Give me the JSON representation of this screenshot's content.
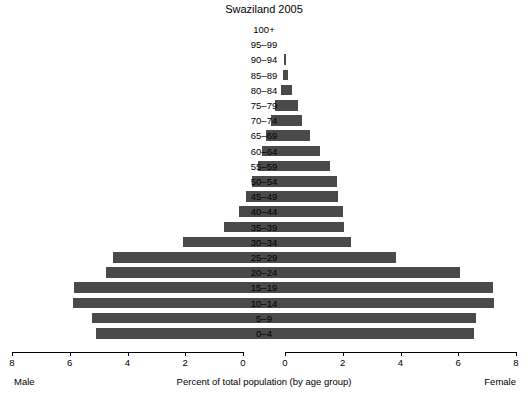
{
  "chart_data": {
    "type": "bar",
    "title": "Swaziland 2005",
    "xlabel": "Percent of total population (by age group)",
    "ylabel": "",
    "orientation": "population-pyramid",
    "left_series_label": "Male",
    "right_series_label": "Female",
    "xlim": [
      0,
      8
    ],
    "xticks": [
      8,
      6,
      4,
      2,
      0
    ],
    "xticks_right": [
      0,
      2,
      4,
      6,
      8
    ],
    "grid": false,
    "legend": "none",
    "bar_color": "#4a4a4a",
    "categories": [
      "100+",
      "95–99",
      "90–94",
      "85–89",
      "80–84",
      "75–79",
      "70–74",
      "65–69",
      "60–64",
      "55–59",
      "50–54",
      "45–49",
      "40–44",
      "35–39",
      "30–34",
      "25–29",
      "20–24",
      "15–19",
      "10–14",
      "5–9",
      "0–4"
    ],
    "series": [
      {
        "name": "Male",
        "values": [
          0.0,
          0.0,
          0.02,
          0.06,
          0.15,
          0.35,
          0.5,
          0.65,
          0.8,
          0.95,
          1.15,
          1.35,
          1.6,
          2.1,
          3.55,
          5.95,
          6.2,
          7.3,
          7.35,
          6.7,
          6.55
        ]
      },
      {
        "name": "Female",
        "values": [
          0.0,
          0.0,
          0.02,
          0.1,
          0.25,
          0.45,
          0.6,
          0.85,
          1.2,
          1.55,
          1.8,
          1.85,
          2.0,
          2.05,
          2.3,
          3.85,
          6.05,
          7.2,
          7.25,
          6.6,
          6.55
        ]
      }
    ]
  },
  "axis": {
    "left_ticks": [
      "8",
      "6",
      "4",
      "2",
      "0"
    ],
    "right_ticks": [
      "0",
      "2",
      "4",
      "6",
      "8"
    ],
    "male_caption": "Male",
    "female_caption": "Female",
    "center_caption": "Percent of total population (by age group)"
  }
}
